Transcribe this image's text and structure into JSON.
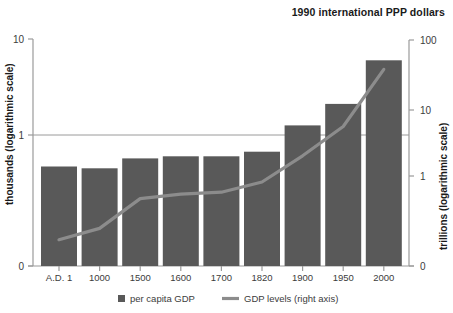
{
  "header": {
    "note": "1990 international PPP dollars"
  },
  "chart_data": {
    "type": "bar",
    "title": "1990 international PPP dollars",
    "xlabel": "",
    "ylabel": "thousands (logarithmic scale)",
    "y2label": "trillions (logarithmic scale)",
    "grid": true,
    "legend_position": "bottom",
    "categories": [
      "A.D. 1",
      "1000",
      "1500",
      "1600",
      "1700",
      "1820",
      "1900",
      "1950",
      "2000"
    ],
    "yticks": [
      "10",
      "1",
      "0"
    ],
    "y2ticks": [
      "100",
      "10",
      "1",
      "0"
    ],
    "ylim": [
      0,
      10
    ],
    "y2lim": [
      0,
      100
    ],
    "series": [
      {
        "name": "per capita GDP",
        "type": "bar",
        "axis": "left",
        "unit": "thousands of 1990 international PPP dollars",
        "values": [
          0.47,
          0.45,
          0.57,
          0.6,
          0.6,
          0.67,
          1.26,
          2.11,
          6.0
        ]
      },
      {
        "name": "GDP levels (right axis)",
        "type": "line",
        "axis": "right",
        "unit": "trillions of 1990 international PPP dollars",
        "values": [
          0.02,
          0.04,
          0.25,
          0.33,
          0.37,
          0.69,
          1.98,
          5.34,
          37.0
        ]
      }
    ]
  },
  "legend": {
    "items": [
      {
        "label": "per capita GDP",
        "marker": "square",
        "color": "#595959"
      },
      {
        "label": "GDP levels (right axis)",
        "marker": "line",
        "color": "#8a8a8a"
      }
    ]
  },
  "colors": {
    "bar": "#595959",
    "line": "#8c8c8c",
    "axis": "#9a9a9a",
    "text": "#3c3c3c",
    "title": "#1a1a1a",
    "background": "#ffffff"
  }
}
